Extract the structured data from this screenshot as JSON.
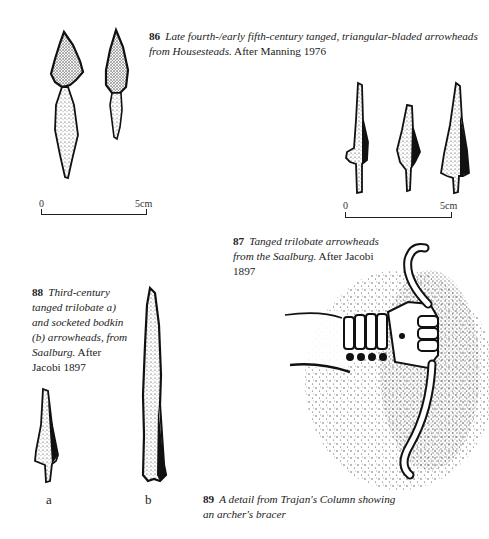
{
  "figures": [
    {
      "id": "86",
      "number": "86",
      "caption_italic": "Late fourth-/early fifth-century tanged, triangular-bladed arrowheads from Housesteads.",
      "caption_roman": "After Manning 1976",
      "scale": {
        "start": "0",
        "end": "5cm"
      }
    },
    {
      "id": "87",
      "number": "87",
      "caption_italic": "Tanged trilobate arrowheads from the Saalburg.",
      "caption_roman": "After Jacobi 1897",
      "scale": {
        "start": "0",
        "end": "5cm"
      }
    },
    {
      "id": "88",
      "number": "88",
      "caption_italic": "Third-century tanged trilobate a) and socketed bodkin (b) arrowheads, from Saalburg.",
      "caption_roman": "After Jacobi 1897",
      "labels": {
        "a": "a",
        "b": "b"
      }
    },
    {
      "id": "89",
      "number": "89",
      "caption_italic": "A detail from Trajan's Column showing an archer's bracer",
      "caption_roman": ""
    }
  ],
  "colors": {
    "ink": "#111111",
    "paper": "#ffffff",
    "stipple": "#2a2a2a"
  }
}
